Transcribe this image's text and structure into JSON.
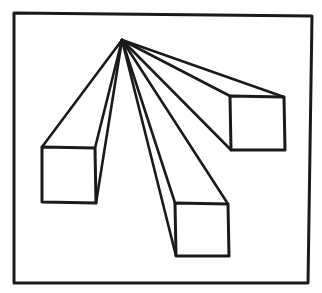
{
  "diagram": {
    "title": "",
    "type": "one-point-perspective",
    "stroke_color": "#1a1a1a",
    "background": "#ffffff",
    "frame": {
      "points": "14,13 312,16 308,283 14,283"
    },
    "vanishing_point": {
      "x": 122,
      "y": 40
    },
    "boxes": [
      {
        "name": "left-box",
        "front": "42,147 95,148 96,203 42,202",
        "rays": [
          [
            42,
            147
          ],
          [
            95,
            148
          ],
          [
            96,
            203
          ]
        ]
      },
      {
        "name": "bottom-box",
        "front": "175,203 228,204 229,256 176,256",
        "rays": [
          [
            175,
            203
          ],
          [
            228,
            204
          ],
          [
            176,
            256
          ]
        ]
      },
      {
        "name": "right-box",
        "front": "230,96 284,97 285,150 231,150",
        "rays": [
          [
            230,
            96
          ],
          [
            284,
            97
          ],
          [
            231,
            150
          ]
        ]
      }
    ]
  }
}
